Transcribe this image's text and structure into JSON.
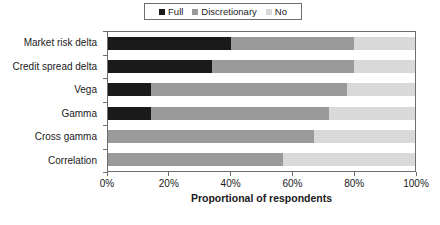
{
  "chart_data": {
    "type": "bar",
    "orientation": "horizontal",
    "stacked": true,
    "stack_mode": "percent",
    "title": "",
    "xlabel": "Proportional of respondents",
    "ylabel": "",
    "xlim": [
      0,
      100
    ],
    "xticks": [
      0,
      20,
      40,
      60,
      80,
      100
    ],
    "xticklabels": [
      "0%",
      "20%",
      "40%",
      "60%",
      "80%",
      "100%"
    ],
    "grid": false,
    "legend_position": "top-center",
    "categories": [
      "Market risk delta",
      "Credit spread delta",
      "Vega",
      "Gamma",
      "Cross gamma",
      "Correlation"
    ],
    "series": [
      {
        "name": "Full",
        "color": "#1a1a1a",
        "values": [
          40,
          34,
          14,
          14,
          0,
          0
        ]
      },
      {
        "name": "Discretionary",
        "color": "#9a9a9a",
        "values": [
          40,
          46,
          64,
          58,
          67,
          57
        ]
      },
      {
        "name": "No",
        "color": "#d9d9d9",
        "values": [
          20,
          20,
          22,
          28,
          33,
          43
        ]
      }
    ],
    "legend": [
      {
        "label": "Full",
        "color": "#1a1a1a"
      },
      {
        "label": "Discretionary",
        "color": "#9a9a9a"
      },
      {
        "label": "No",
        "color": "#d9d9d9"
      }
    ],
    "axis_color": "#6e6e6e"
  }
}
